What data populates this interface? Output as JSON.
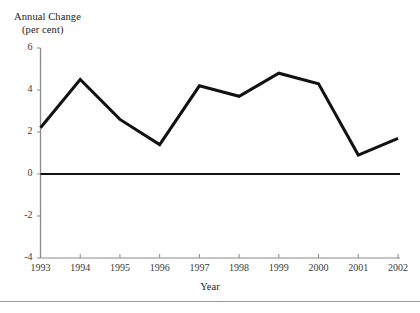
{
  "figure": {
    "y_axis_title_line1": "Annual Change",
    "y_axis_title_line2": "(per cent)",
    "x_axis_title": "Year"
  },
  "chart_data": {
    "type": "line",
    "title": "",
    "subtitle": "",
    "xlabel": "Year",
    "ylabel": "Annual Change (per cent)",
    "categories": [
      "1993",
      "1994",
      "1995",
      "1996",
      "1997",
      "1998",
      "1999",
      "2000",
      "2001",
      "2002"
    ],
    "x": [
      1993,
      1994,
      1995,
      1996,
      1997,
      1998,
      1999,
      2000,
      2001,
      2002
    ],
    "values": [
      2.2,
      4.5,
      2.6,
      1.4,
      4.2,
      3.7,
      4.8,
      4.3,
      0.9,
      1.7
    ],
    "series": [
      {
        "name": "Annual Change (per cent)",
        "values": [
          2.2,
          4.5,
          2.6,
          1.4,
          4.2,
          3.7,
          4.8,
          4.3,
          0.9,
          1.7
        ],
        "color": "#111111",
        "line_width": 3
      }
    ],
    "ylim": [
      -4,
      6
    ],
    "yticks": [
      6,
      4,
      2,
      0,
      -2,
      -4
    ],
    "ytick_labels": [
      "6",
      "4",
      "2",
      "0",
      "-2",
      "-4"
    ],
    "xtick_labels": [
      "1993",
      "1994",
      "1995",
      "1996",
      "1997",
      "1998",
      "1999",
      "2000",
      "2001",
      "2002"
    ],
    "grid": false,
    "legend": "none",
    "zero_line": 0,
    "axis_color": "#8a8a8a",
    "zero_line_color": "#111111"
  }
}
